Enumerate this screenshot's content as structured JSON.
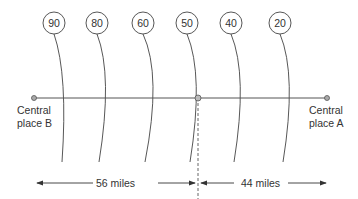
{
  "diagram": {
    "title": "",
    "places": [
      {
        "label_line1": "Central",
        "label_line2": "place B",
        "x": 34
      },
      {
        "label_line1": "Central",
        "label_line2": "place A",
        "x": 327
      }
    ],
    "boundary_x": 198,
    "contours": [
      {
        "value": "90",
        "cx": 54
      },
      {
        "value": "80",
        "cx": 97
      },
      {
        "value": "60",
        "cx": 143
      },
      {
        "value": "50",
        "cx": 187
      },
      {
        "value": "40",
        "cx": 231
      },
      {
        "value": "20",
        "cx": 280
      }
    ],
    "distances": {
      "left": "56 miles",
      "right": "44 miles"
    },
    "colors": {
      "line": "#555555",
      "dot_fill": "#aaaaaa",
      "text": "#333333"
    }
  }
}
